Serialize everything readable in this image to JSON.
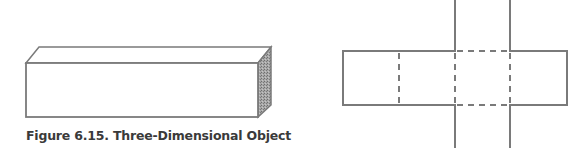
{
  "figure": {
    "caption": "Figure 6.15. Three-Dimensional Object",
    "stroke_color": "#7a7a7a",
    "side_face_color": "#8c8c8c",
    "objects": [
      {
        "name": "rectangular-prism",
        "description": "Long rectangular box drawn in oblique projection with shaded right end face"
      },
      {
        "name": "prism-net",
        "description": "Cross-shaped net: horizontal strip of four faces with dashed fold lines, two vertical flaps above and below the third face"
      }
    ]
  }
}
